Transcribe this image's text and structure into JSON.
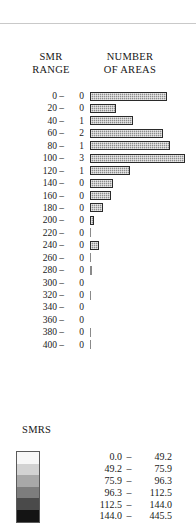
{
  "top_rule": true,
  "chart": {
    "header": {
      "left_line1": "SMR",
      "left_line2": "RANGE",
      "right_line1": "NUMBER",
      "right_line2": "OF AREAS"
    },
    "rows": [
      {
        "range": "0 –",
        "count": "0",
        "bar_px": 77
      },
      {
        "range": "20 –",
        "count": "0",
        "bar_px": 26
      },
      {
        "range": "40 –",
        "count": "1",
        "bar_px": 43
      },
      {
        "range": "60 –",
        "count": "2",
        "bar_px": 73
      },
      {
        "range": "80 –",
        "count": "1",
        "bar_px": 80
      },
      {
        "range": "100 –",
        "count": "3",
        "bar_px": 95
      },
      {
        "range": "120 –",
        "count": "1",
        "bar_px": 40
      },
      {
        "range": "140 –",
        "count": "0",
        "bar_px": 23
      },
      {
        "range": "160 –",
        "count": "0",
        "bar_px": 21
      },
      {
        "range": "180 –",
        "count": "0",
        "bar_px": 13
      },
      {
        "range": "200 –",
        "count": "0",
        "bar_px": 4
      },
      {
        "range": "220 –",
        "count": "0",
        "bar_px": 1
      },
      {
        "range": "240 –",
        "count": "0",
        "bar_px": 9
      },
      {
        "range": "260 –",
        "count": "0",
        "bar_px": 1
      },
      {
        "range": "280 –",
        "count": "0",
        "bar_px": 2
      },
      {
        "range": "300 –",
        "count": "0",
        "bar_px": 0
      },
      {
        "range": "320 –",
        "count": "0",
        "bar_px": 1
      },
      {
        "range": "340 –",
        "count": "0",
        "bar_px": 0
      },
      {
        "range": "360 –",
        "count": "0",
        "bar_px": 0
      },
      {
        "range": "380 –",
        "count": "0",
        "bar_px": 1
      },
      {
        "range": "400 –",
        "count": "0",
        "bar_px": 1
      }
    ]
  },
  "legend": {
    "title": "SMRS",
    "classes": [
      {
        "lo": "0.0",
        "dash": "–",
        "hi": "49.2",
        "color": "#f7f7f7"
      },
      {
        "lo": "49.2",
        "dash": "–",
        "hi": "75.9",
        "color": "#d2d2d2"
      },
      {
        "lo": "75.9",
        "dash": "–",
        "hi": "96.3",
        "color": "#a8a8a8"
      },
      {
        "lo": "96.3",
        "dash": "–",
        "hi": "112.5",
        "color": "#7d7d7d"
      },
      {
        "lo": "112.5",
        "dash": "–",
        "hi": "144.0",
        "color": "#4a4a4a"
      },
      {
        "lo": "144.0",
        "dash": "–",
        "hi": "445.5",
        "color": "#141414"
      }
    ]
  },
  "chart_data": {
    "type": "bar",
    "title": "",
    "xlabel": "NUMBER OF AREAS",
    "ylabel": "SMR RANGE",
    "orientation": "horizontal",
    "grid": false,
    "legend_position": "bottom",
    "categories": [
      "0 –",
      "20 –",
      "40 –",
      "60 –",
      "80 –",
      "100 –",
      "120 –",
      "140 –",
      "160 –",
      "180 –",
      "200 –",
      "220 –",
      "240 –",
      "260 –",
      "280 –",
      "300 –",
      "320 –",
      "340 –",
      "360 –",
      "380 –",
      "400 –"
    ],
    "labeled_counts": [
      0,
      0,
      1,
      2,
      1,
      3,
      1,
      0,
      0,
      0,
      0,
      0,
      0,
      0,
      0,
      0,
      0,
      0,
      0,
      0,
      0
    ]
  }
}
